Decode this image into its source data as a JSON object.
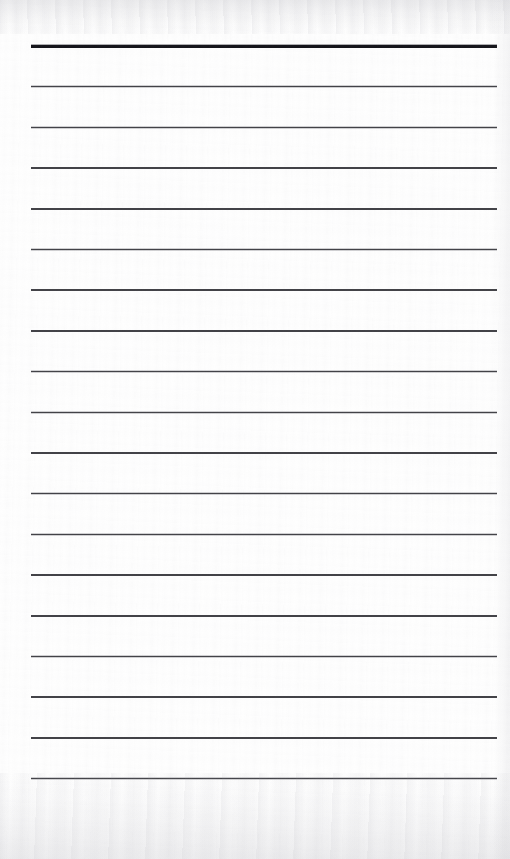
{
  "document": {
    "kind": "scanned-lined-paper",
    "title": "",
    "body_text": "",
    "page_width": 510,
    "page_height": 859,
    "background_color": "#fefefe",
    "is_blank": true
  },
  "ruling": {
    "line_count": 19,
    "first_line_y": 46,
    "line_spacing": 40.7,
    "left_margin_x": 31,
    "right_margin_x": 497,
    "line_length": 466,
    "rule_color": "#3a3a3e",
    "header_rule_color": "#121216",
    "rule_thickness": 1.5,
    "header_rule_thickness": 3,
    "header_rule_index": 0,
    "lines": [
      {
        "index": 0,
        "y": 46,
        "thickness": 3,
        "color": "#121216",
        "emphasis": "header"
      },
      {
        "index": 1,
        "y": 86.7,
        "thickness": 1.5,
        "color": "#3a3a3e",
        "emphasis": "normal"
      },
      {
        "index": 2,
        "y": 127.4,
        "thickness": 1.5,
        "color": "#3a3a3e",
        "emphasis": "normal"
      },
      {
        "index": 3,
        "y": 168.1,
        "thickness": 1.5,
        "color": "#3a3a3e",
        "emphasis": "normal"
      },
      {
        "index": 4,
        "y": 208.8,
        "thickness": 1.5,
        "color": "#3a3a3e",
        "emphasis": "normal"
      },
      {
        "index": 5,
        "y": 249.5,
        "thickness": 1.5,
        "color": "#3a3a3e",
        "emphasis": "normal"
      },
      {
        "index": 6,
        "y": 290.2,
        "thickness": 1.5,
        "color": "#3a3a3e",
        "emphasis": "normal"
      },
      {
        "index": 7,
        "y": 330.9,
        "thickness": 1.5,
        "color": "#3a3a3e",
        "emphasis": "normal"
      },
      {
        "index": 8,
        "y": 371.6,
        "thickness": 1.5,
        "color": "#3a3a3e",
        "emphasis": "normal"
      },
      {
        "index": 9,
        "y": 412.3,
        "thickness": 1.5,
        "color": "#3a3a3e",
        "emphasis": "normal"
      },
      {
        "index": 10,
        "y": 453.0,
        "thickness": 1.5,
        "color": "#3a3a3e",
        "emphasis": "normal"
      },
      {
        "index": 11,
        "y": 493.7,
        "thickness": 1.5,
        "color": "#3a3a3e",
        "emphasis": "normal"
      },
      {
        "index": 12,
        "y": 534.4,
        "thickness": 1.5,
        "color": "#3a3a3e",
        "emphasis": "normal"
      },
      {
        "index": 13,
        "y": 575.1,
        "thickness": 1.5,
        "color": "#3a3a3e",
        "emphasis": "normal"
      },
      {
        "index": 14,
        "y": 615.8,
        "thickness": 1.5,
        "color": "#3a3a3e",
        "emphasis": "normal"
      },
      {
        "index": 15,
        "y": 656.5,
        "thickness": 1.5,
        "color": "#3a3a3e",
        "emphasis": "normal"
      },
      {
        "index": 16,
        "y": 697.2,
        "thickness": 1.5,
        "color": "#3a3a3e",
        "emphasis": "normal"
      },
      {
        "index": 17,
        "y": 737.9,
        "thickness": 1.5,
        "color": "#3a3a3e",
        "emphasis": "normal"
      },
      {
        "index": 18,
        "y": 778.6,
        "thickness": 1.5,
        "color": "#3a3a3e",
        "emphasis": "normal"
      }
    ]
  },
  "scan_artifacts": {
    "top_haze": true,
    "bottom_haze": true,
    "right_edge_shading": true,
    "grain": true
  }
}
